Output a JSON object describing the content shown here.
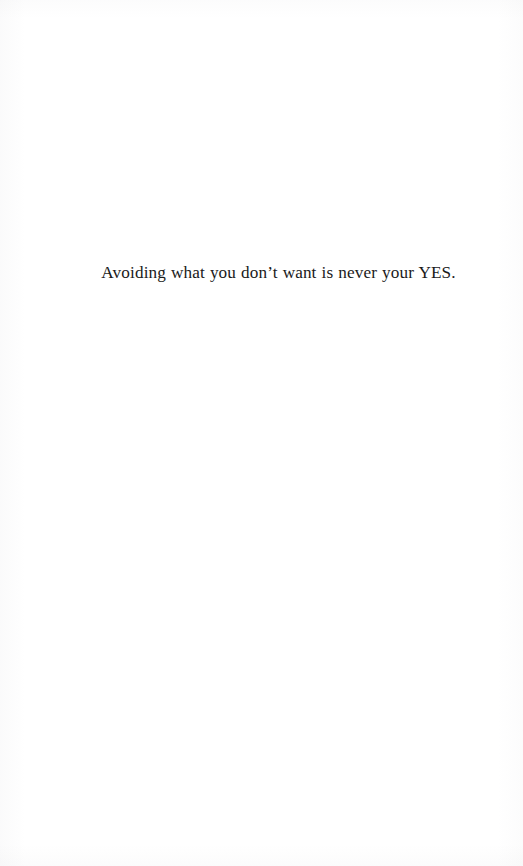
{
  "page": {
    "background_color": "#ffffff",
    "ink_color": "#1a1a1a",
    "width": 523,
    "height": 866
  },
  "content": {
    "epigraph": "Avoiding what you don’t want is never your YES."
  }
}
